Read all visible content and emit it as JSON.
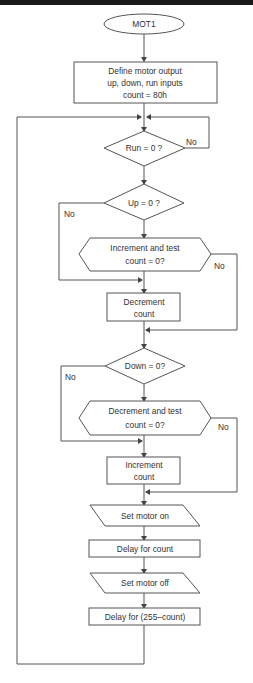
{
  "diagram": {
    "type": "flowchart",
    "title": "MOT1",
    "nodes": {
      "start": {
        "shape": "terminator",
        "label": "MOT1"
      },
      "init": {
        "shape": "process",
        "lines": [
          "Define motor output",
          "up, down, run inputs",
          "count = 80h"
        ]
      },
      "run_check": {
        "shape": "decision",
        "label": "Run = 0 ?",
        "no_label": "No"
      },
      "up_check": {
        "shape": "decision",
        "label": "Up = 0 ?",
        "no_label": "No"
      },
      "inc_test": {
        "shape": "preparation",
        "lines": [
          "Increment and test",
          "count = 0?"
        ],
        "no_label": "No"
      },
      "decrement": {
        "shape": "process",
        "lines": [
          "Decrement",
          "count"
        ]
      },
      "down_check": {
        "shape": "decision",
        "label": "Down = 0?",
        "no_label": "No"
      },
      "dec_test": {
        "shape": "preparation",
        "lines": [
          "Decrement and test",
          "count = 0?"
        ],
        "no_label": "No"
      },
      "increment": {
        "shape": "process",
        "lines": [
          "Increment",
          "count"
        ]
      },
      "motor_on": {
        "shape": "io",
        "label": "Set motor on"
      },
      "delay_count": {
        "shape": "process",
        "label": "Delay for count"
      },
      "motor_off": {
        "shape": "io",
        "label": "Set motor off"
      },
      "delay_rest": {
        "shape": "process",
        "label": "Delay for (255–count)"
      }
    },
    "colors": {
      "line": "#555555",
      "text": "#333333",
      "background": "#ffffff",
      "topbar": "#1a1a1a"
    }
  }
}
